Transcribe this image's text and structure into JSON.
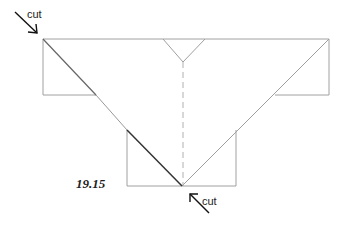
{
  "figure": {
    "number": "19.15",
    "labels": {
      "cut_top_left": "cut",
      "cut_bottom": "cut"
    },
    "colors": {
      "outline": "#9a9a9a",
      "cut_line": "#333333",
      "fold_line": "#b0b0b0"
    }
  }
}
